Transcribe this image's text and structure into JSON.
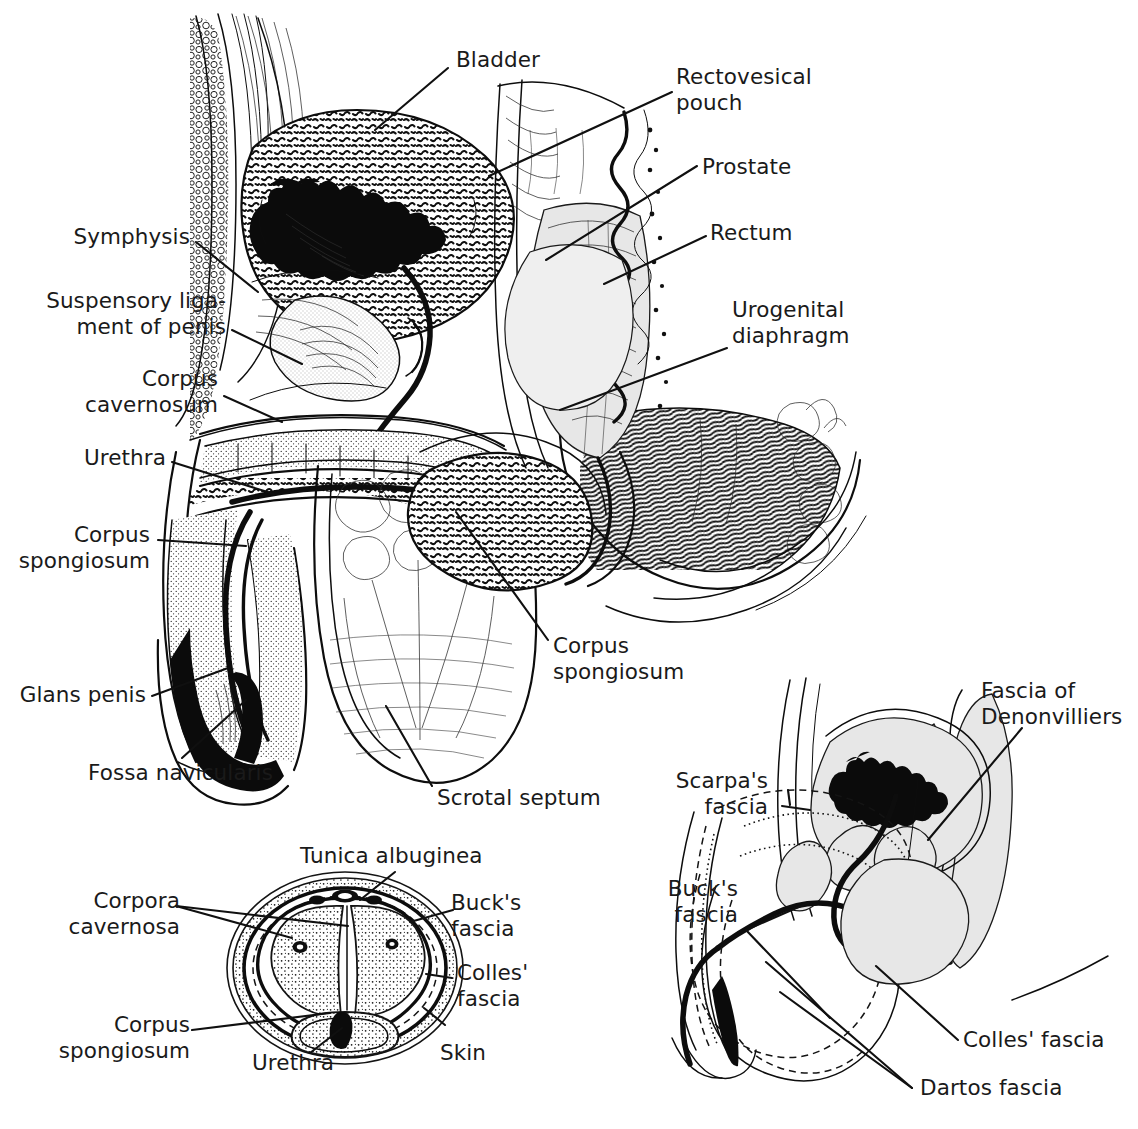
{
  "figure": {
    "panels": [
      "sagittal-section",
      "penis-cross-section",
      "fascial-planes"
    ]
  },
  "colors": {
    "ink": "#0d0d0d",
    "paper": "#ffffff",
    "shade": "#e7e7e7"
  },
  "main_panel": {
    "name": "sagittal-section",
    "labels": [
      {
        "id": "bladder",
        "text": "Bladder"
      },
      {
        "id": "rectovesical-pouch",
        "text": "Rectovesical\npouch"
      },
      {
        "id": "prostate",
        "text": "Prostate"
      },
      {
        "id": "rectum",
        "text": "Rectum"
      },
      {
        "id": "urogenital-diaphragm",
        "text": "Urogenital\ndiaphragm"
      },
      {
        "id": "symphysis",
        "text": "Symphysis"
      },
      {
        "id": "suspensory-ligament",
        "text": "Suspensory liga-\nment of penis"
      },
      {
        "id": "corpus-cavernosum",
        "text": "Corpus\ncavernosum"
      },
      {
        "id": "urethra",
        "text": "Urethra"
      },
      {
        "id": "corpus-spongiosum-left",
        "text": "Corpus\nspongiosum"
      },
      {
        "id": "glans-penis",
        "text": "Glans penis"
      },
      {
        "id": "fossa-navicularis",
        "text": "Fossa navicularis"
      },
      {
        "id": "corpus-spongiosum-mid",
        "text": "Corpus\nspongiosum"
      },
      {
        "id": "scrotal-septum",
        "text": "Scrotal septum"
      }
    ]
  },
  "cross_section_panel": {
    "name": "penis-cross-section",
    "labels": [
      {
        "id": "tunica-albuginea",
        "text": "Tunica albuginea"
      },
      {
        "id": "corpora-cavernosa",
        "text": "Corpora\ncavernosa"
      },
      {
        "id": "bucks-fascia",
        "text": "Buck's\nfascia"
      },
      {
        "id": "colles-fascia",
        "text": "Colles'\nfascia"
      },
      {
        "id": "corpus-spongiosum",
        "text": "Corpus\nspongiosum"
      },
      {
        "id": "urethra",
        "text": "Urethra"
      },
      {
        "id": "skin",
        "text": "Skin"
      }
    ]
  },
  "fascia_panel": {
    "name": "fascial-planes",
    "labels": [
      {
        "id": "fascia-of-denonvilliers",
        "text": "Fascia of\nDenonvilliers"
      },
      {
        "id": "scarpas-fascia",
        "text": "Scarpa's\nfascia"
      },
      {
        "id": "bucks-fascia",
        "text": "Buck's\nfascia"
      },
      {
        "id": "colles-fascia",
        "text": "Colles' fascia"
      },
      {
        "id": "dartos-fascia",
        "text": "Dartos fascia"
      }
    ]
  }
}
